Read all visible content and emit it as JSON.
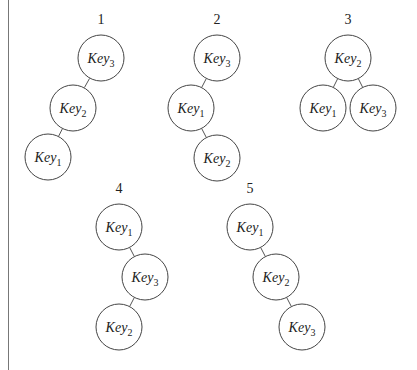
{
  "figure": {
    "caption_visible": false,
    "trees": [
      {
        "label": "1",
        "label_pos": [
          101,
          20
        ],
        "nodes": [
          {
            "key": "Key",
            "sub": "3",
            "pos": [
              101,
              58
            ]
          },
          {
            "key": "Key",
            "sub": "2",
            "pos": [
              73,
              108
            ]
          },
          {
            "key": "Key",
            "sub": "1",
            "pos": [
              48,
              157
            ]
          }
        ],
        "edges": [
          [
            0,
            1
          ],
          [
            1,
            2
          ]
        ]
      },
      {
        "label": "2",
        "label_pos": [
          217,
          20
        ],
        "nodes": [
          {
            "key": "Key",
            "sub": "3",
            "pos": [
              217,
              58
            ]
          },
          {
            "key": "Key",
            "sub": "1",
            "pos": [
              191,
              108
            ]
          },
          {
            "key": "Key",
            "sub": "2",
            "pos": [
              217,
              158
            ]
          }
        ],
        "edges": [
          [
            0,
            1
          ],
          [
            1,
            2
          ]
        ]
      },
      {
        "label": "3",
        "label_pos": [
          348,
          20
        ],
        "nodes": [
          {
            "key": "Key",
            "sub": "2",
            "pos": [
              348,
              58
            ]
          },
          {
            "key": "Key",
            "sub": "1",
            "pos": [
              323,
              108
            ]
          },
          {
            "key": "Key",
            "sub": "3",
            "pos": [
              373,
              108
            ]
          }
        ],
        "edges": [
          [
            0,
            1
          ],
          [
            0,
            2
          ]
        ]
      },
      {
        "label": "4",
        "label_pos": [
          119,
          189
        ],
        "nodes": [
          {
            "key": "Key",
            "sub": "1",
            "pos": [
              119,
              227
            ]
          },
          {
            "key": "Key",
            "sub": "3",
            "pos": [
              145,
              277
            ]
          },
          {
            "key": "Key",
            "sub": "2",
            "pos": [
              119,
              327
            ]
          }
        ],
        "edges": [
          [
            0,
            1
          ],
          [
            1,
            2
          ]
        ]
      },
      {
        "label": "5",
        "label_pos": [
          250,
          189
        ],
        "nodes": [
          {
            "key": "Key",
            "sub": "1",
            "pos": [
              250,
              227
            ]
          },
          {
            "key": "Key",
            "sub": "2",
            "pos": [
              276,
              277
            ]
          },
          {
            "key": "Key",
            "sub": "3",
            "pos": [
              302,
              327
            ]
          }
        ],
        "edges": [
          [
            0,
            1
          ],
          [
            1,
            2
          ]
        ]
      }
    ]
  }
}
